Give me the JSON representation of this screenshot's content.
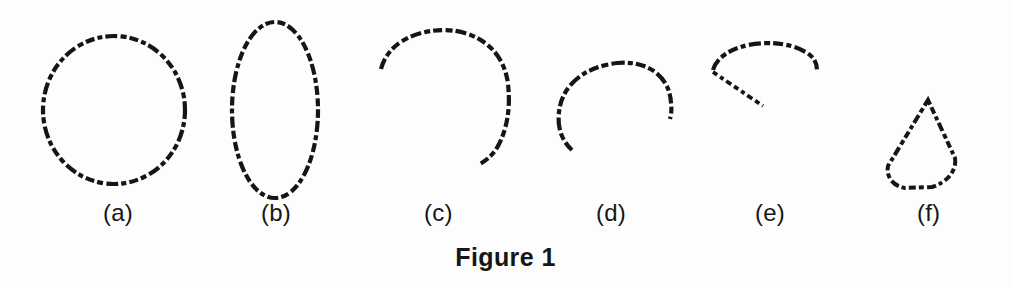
{
  "figure": {
    "caption": "Figure 1",
    "background_color": "#fdfdfd",
    "ink_color": "#151515",
    "width": 1011,
    "height": 287
  },
  "panels": [
    {
      "key": "a",
      "label": "(a)",
      "shape": "circle",
      "description": "closed circular contour",
      "label_x": 103,
      "label_y": 199,
      "geometry": {
        "cx": 114,
        "cy": 110,
        "rx": 71,
        "ry": 74
      }
    },
    {
      "key": "b",
      "label": "(b)",
      "shape": "ellipse",
      "description": "closed vertical elliptical contour",
      "label_x": 261,
      "label_y": 199,
      "geometry": {
        "cx": 275,
        "cy": 110,
        "rx": 43,
        "ry": 88
      }
    },
    {
      "key": "c",
      "label": "(c)",
      "shape": "open-arc",
      "description": "open arc, gap at lower left, hooked lower end",
      "label_x": 424,
      "label_y": 199,
      "geometry": {
        "cx": 445,
        "cy": 100,
        "rx": 65,
        "ry": 70
      }
    },
    {
      "key": "d",
      "label": "(d)",
      "shape": "open-arc",
      "description": "open arc, gap at bottom, tail to lower right",
      "label_x": 596,
      "label_y": 199,
      "geometry": {
        "cx": 618,
        "cy": 105,
        "rx": 57,
        "ry": 58
      }
    },
    {
      "key": "e",
      "label": "(e)",
      "shape": "arc-with-tail",
      "description": "shallow arc over the top with a straight diagonal tail descending to the right",
      "label_x": 755,
      "label_y": 199,
      "geometry": {
        "cx": 768,
        "cy": 102,
        "rx": 58,
        "ry": 50
      }
    },
    {
      "key": "f",
      "label": "(f)",
      "shape": "cone-sector",
      "description": "closed cone / circular sector, apex at top, rounded base",
      "label_x": 917,
      "label_y": 199,
      "geometry": {
        "apex_x": 928,
        "apex_y": 100,
        "base_y": 190,
        "left_x": 888,
        "right_x": 956
      }
    }
  ]
}
